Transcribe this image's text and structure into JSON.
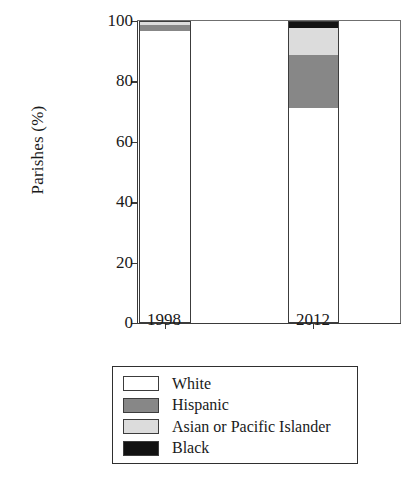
{
  "chart_data": {
    "type": "bar",
    "subtype": "stacked-100-percent",
    "title": "",
    "xlabel": "",
    "ylabel": "Parishes (%)",
    "categories": [
      "1998",
      "2012"
    ],
    "ylim": [
      0,
      100
    ],
    "yticks": [
      0,
      20,
      40,
      60,
      80,
      100
    ],
    "ytick_labels": [
      "0",
      "20",
      "40",
      "60",
      "80",
      "100"
    ],
    "grid": false,
    "legend_position": "below-axes",
    "series": [
      {
        "name": "White",
        "color": "#ffffff",
        "values": [
          96.5,
          71.0
        ]
      },
      {
        "name": "Hispanic",
        "color": "#878787",
        "values": [
          2.0,
          17.5
        ]
      },
      {
        "name": "Asian or Pacific Islander",
        "color": "#dcdcdc",
        "values": [
          1.0,
          9.0
        ]
      },
      {
        "name": "Black",
        "color": "#121212",
        "values": [
          0.5,
          2.5
        ]
      }
    ]
  },
  "axes": {
    "y_title": "Parishes (%)",
    "y_ticks": [
      "100",
      "80",
      "60",
      "40",
      "20",
      "0"
    ],
    "x_ticks": [
      "1998",
      "2012"
    ]
  },
  "legend": {
    "items": [
      {
        "label": "White",
        "swatch_color": "#ffffff"
      },
      {
        "label": "Hispanic",
        "swatch_color": "#878787"
      },
      {
        "label": "Asian or Pacific Islander",
        "swatch_color": "#dcdcdc"
      },
      {
        "label": "Black",
        "swatch_color": "#121212"
      }
    ]
  }
}
